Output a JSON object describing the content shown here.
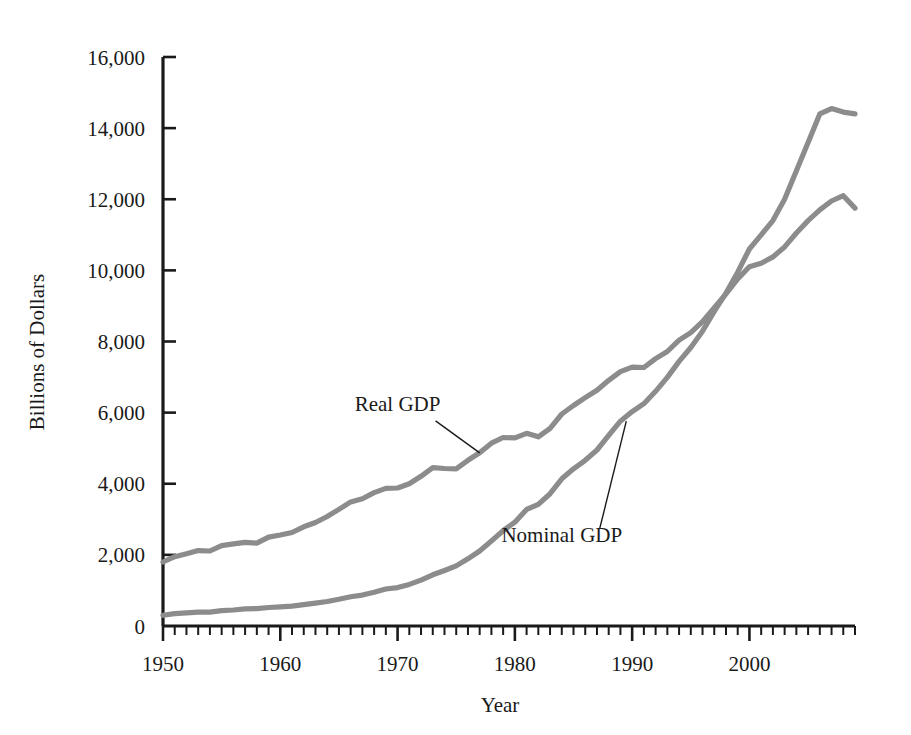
{
  "chart_data": {
    "type": "line",
    "title": "",
    "xlabel": "Year",
    "ylabel": "Billions of Dollars",
    "xlim": [
      1950,
      2009
    ],
    "ylim": [
      0,
      16000
    ],
    "grid": false,
    "legend_position": "inline-annotations",
    "y_ticks": [
      0,
      2000,
      4000,
      6000,
      8000,
      10000,
      12000,
      14000,
      16000
    ],
    "y_tick_labels": [
      "0",
      "2,000",
      "4,000",
      "6,000",
      "8,000",
      "10,000",
      "12,000",
      "14,000",
      "16,000"
    ],
    "x_ticks": [
      1950,
      1960,
      1970,
      1980,
      1990,
      2000
    ],
    "x_tick_labels": [
      "1950",
      "1960",
      "1970",
      "1980",
      "1990",
      "2000"
    ],
    "x_minor_tick_step": 1,
    "series": [
      {
        "name": "Real GDP",
        "color": "#8c8c8c",
        "x": [
          1950,
          1951,
          1952,
          1953,
          1954,
          1955,
          1956,
          1957,
          1958,
          1959,
          1960,
          1961,
          1962,
          1963,
          1964,
          1965,
          1966,
          1967,
          1968,
          1969,
          1970,
          1971,
          1972,
          1973,
          1974,
          1975,
          1976,
          1977,
          1978,
          1979,
          1980,
          1981,
          1982,
          1983,
          1984,
          1985,
          1986,
          1987,
          1988,
          1989,
          1990,
          1991,
          1992,
          1993,
          1994,
          1995,
          1996,
          1997,
          1998,
          1999,
          2000,
          2001,
          2002,
          2003,
          2004,
          2005,
          2006,
          2007,
          2008,
          2009
        ],
        "values": [
          1800,
          1950,
          2030,
          2120,
          2110,
          2260,
          2310,
          2350,
          2330,
          2500,
          2560,
          2630,
          2790,
          2910,
          3080,
          3280,
          3490,
          3580,
          3750,
          3870,
          3880,
          4000,
          4210,
          4450,
          4430,
          4420,
          4660,
          4870,
          5140,
          5300,
          5290,
          5420,
          5320,
          5560,
          5960,
          6200,
          6420,
          6630,
          6910,
          7150,
          7280,
          7270,
          7520,
          7720,
          8040,
          8250,
          8560,
          8950,
          9340,
          9760,
          10100,
          10200,
          10380,
          10660,
          11050,
          11400,
          11700,
          11950,
          12100,
          11750
        ]
      },
      {
        "name": "Nominal GDP",
        "color": "#8c8c8c",
        "x": [
          1950,
          1951,
          1952,
          1953,
          1954,
          1955,
          1956,
          1957,
          1958,
          1959,
          1960,
          1961,
          1962,
          1963,
          1964,
          1965,
          1966,
          1967,
          1968,
          1969,
          1970,
          1971,
          1972,
          1973,
          1974,
          1975,
          1976,
          1977,
          1978,
          1979,
          1980,
          1981,
          1982,
          1983,
          1984,
          1985,
          1986,
          1987,
          1988,
          1989,
          1990,
          1991,
          1992,
          1993,
          1994,
          1995,
          1996,
          1997,
          1998,
          1999,
          2000,
          2001,
          2002,
          2003,
          2004,
          2005,
          2006,
          2007,
          2008,
          2009
        ],
        "values": [
          300,
          350,
          370,
          390,
          390,
          430,
          450,
          480,
          490,
          520,
          540,
          560,
          600,
          640,
          690,
          750,
          820,
          870,
          950,
          1040,
          1080,
          1170,
          1290,
          1440,
          1560,
          1690,
          1890,
          2110,
          2390,
          2680,
          2920,
          3280,
          3420,
          3720,
          4140,
          4420,
          4660,
          4950,
          5360,
          5760,
          6030,
          6250,
          6600,
          6990,
          7440,
          7830,
          8290,
          8850,
          9360,
          9950,
          10600,
          11000,
          11400,
          12000,
          12800,
          13600,
          14400,
          14550,
          14450,
          14400
        ]
      }
    ],
    "annotations": [
      {
        "text": "Real GDP",
        "label_x": 1970.0,
        "label_y": 6050,
        "target_x": 1977.0,
        "target_y": 4870
      },
      {
        "text": "Nominal GDP",
        "label_x": 1984.0,
        "label_y": 2350,
        "target_x": 1989.5,
        "target_y": 5760
      }
    ]
  }
}
